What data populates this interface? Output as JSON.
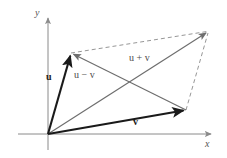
{
  "figure": {
    "axes": {
      "x_label": "x",
      "y_label": "y",
      "origin": [
        48,
        134
      ],
      "x_axis": {
        "from": [
          18,
          134
        ],
        "to": [
          213,
          134
        ]
      },
      "y_axis": {
        "from": [
          48,
          150
        ],
        "to": [
          48,
          16
        ]
      }
    },
    "labels": {
      "u": "u",
      "v": "v",
      "u_minus_v": "u − v",
      "u_plus_v": "u + v"
    },
    "vectors": [
      {
        "name": "u",
        "label": "u",
        "from": [
          48,
          134
        ],
        "to": [
          71,
          53
        ],
        "style": "solid",
        "color": "#1a1a1a",
        "width": 2.1,
        "arrow": true
      },
      {
        "name": "v",
        "label": "v",
        "from": [
          48,
          134
        ],
        "to": [
          186,
          110
        ],
        "style": "solid",
        "color": "#1a1a1a",
        "width": 2.1,
        "arrow": true
      },
      {
        "name": "u-plus-v",
        "label": "u + v",
        "from": [
          48,
          134
        ],
        "to": [
          209,
          31
        ],
        "style": "solid",
        "color": "#6e6e6e",
        "width": 1.2,
        "arrow": true
      },
      {
        "name": "u-minus-v",
        "label": "u − v",
        "from": [
          186,
          110
        ],
        "to": [
          71,
          53
        ],
        "style": "solid",
        "color": "#6e6e6e",
        "width": 1.2,
        "arrow": true
      }
    ],
    "dashed_edges": [
      {
        "name": "u-to-sum",
        "from": [
          71,
          53
        ],
        "to": [
          209,
          31
        ]
      },
      {
        "name": "v-to-sum",
        "from": [
          186,
          110
        ],
        "to": [
          209,
          31
        ]
      }
    ],
    "colors": {
      "background": "#ffffff",
      "axis": "#8a8a8a",
      "vector_bold": "#1a1a1a",
      "vector_light": "#6e6e6e",
      "dashed": "#8a8a8a",
      "text": "#2b2b2b"
    }
  }
}
